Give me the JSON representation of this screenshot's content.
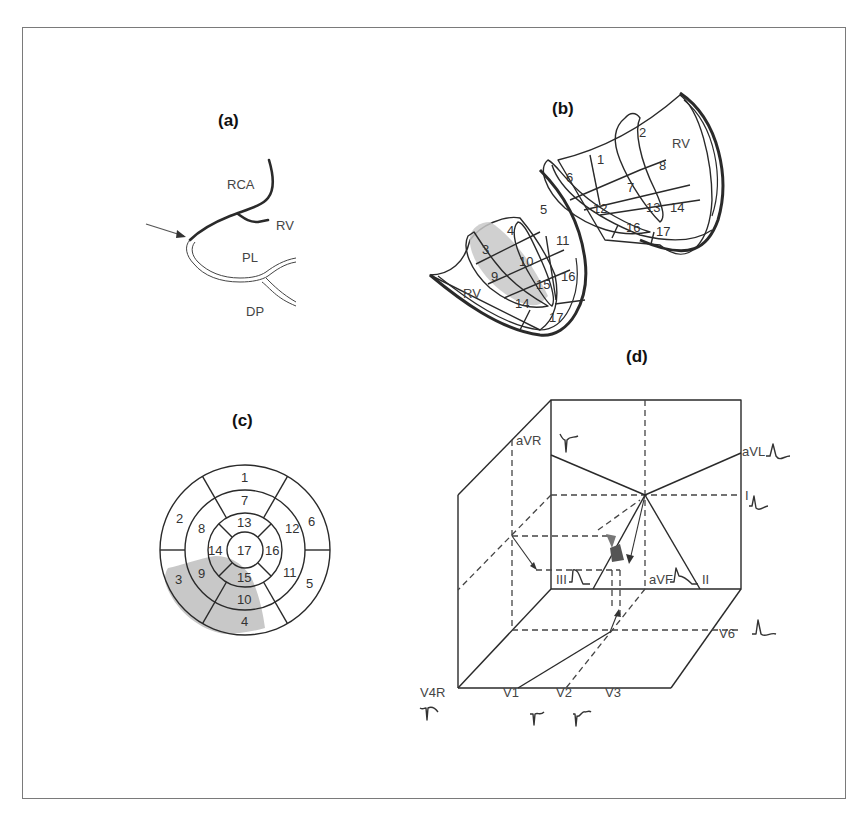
{
  "panels": {
    "a": {
      "label": "(a)",
      "vessels": {
        "rca": "RCA",
        "rv": "RV",
        "pl": "PL",
        "dp": "DP"
      }
    },
    "b": {
      "label": "(b)",
      "rv_left": "RV",
      "rv_right": "RV",
      "segments_left": [
        "3",
        "4",
        "5",
        "9",
        "10",
        "11",
        "14",
        "15",
        "16",
        "17"
      ],
      "segments_right": [
        "1",
        "2",
        "6",
        "7",
        "8",
        "12",
        "13",
        "14",
        "16",
        "17"
      ],
      "highlighted": [
        "3",
        "4",
        "9",
        "10",
        "15"
      ]
    },
    "c": {
      "label": "(c)",
      "outer_ring": [
        "1",
        "6",
        "5",
        "4",
        "3",
        "2"
      ],
      "mid_ring": [
        "7",
        "12",
        "11",
        "10",
        "9",
        "8"
      ],
      "inner_ring": [
        "13",
        "16",
        "15",
        "14"
      ],
      "apex": "17",
      "highlighted": [
        "3",
        "4",
        "9",
        "10",
        "15"
      ]
    },
    "d": {
      "label": "(d)",
      "leads": {
        "avr": "aVR",
        "avl": "aVL",
        "i": "I",
        "iii": "III",
        "avf": "aVF",
        "ii": "II",
        "v6": "V6",
        "v4r": "V4R",
        "v1": "V1",
        "v2": "V2",
        "v3": "V3"
      }
    }
  },
  "colors": {
    "highlight": "#c8c8c8",
    "line": "#2a2a2a",
    "frame": "#7a7a7a"
  }
}
